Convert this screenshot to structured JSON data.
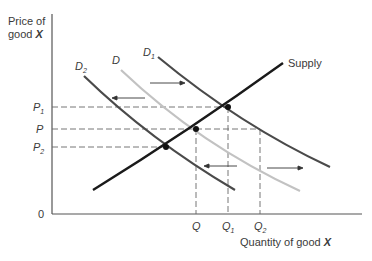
{
  "axes": {
    "y_label_line1": "Price of",
    "y_label_line2": "good X",
    "x_label": "Quantity of good X",
    "origin": "0"
  },
  "price_ticks": [
    {
      "main": "P",
      "sub": "1"
    },
    {
      "main": "P",
      "sub": ""
    },
    {
      "main": "P",
      "sub": "2"
    }
  ],
  "quantity_ticks": [
    {
      "main": "Q",
      "sub": ""
    },
    {
      "main": "Q",
      "sub": "1"
    },
    {
      "main": "Q",
      "sub": "2"
    }
  ],
  "curves": {
    "supply": "Supply",
    "d": {
      "main": "D",
      "sub": ""
    },
    "d1": {
      "main": "D",
      "sub": "1"
    },
    "d2": {
      "main": "D",
      "sub": "2"
    }
  },
  "colors": {
    "dark_curve": "#4a4a4a",
    "light_curve": "#c2c2c2",
    "supply": "#1a1a1a",
    "dashed": "#666666"
  }
}
